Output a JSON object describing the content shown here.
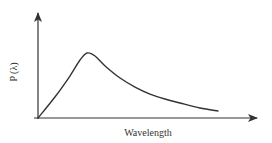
{
  "chart_data": {
    "type": "line",
    "title": "",
    "xlabel": "Wavelength",
    "ylabel": "P (λ)",
    "xlim": [
      0,
      1
    ],
    "ylim": [
      0,
      1
    ],
    "grid": false,
    "legend": null,
    "axis_ticks": false,
    "series": [
      {
        "name": "P(λ)",
        "color": "#333333",
        "x": [
          0.0,
          0.077,
          0.145,
          0.191,
          0.223,
          0.259,
          0.305,
          0.373,
          0.441,
          0.509,
          0.577,
          0.645,
          0.736,
          0.818
        ],
        "y": [
          0.0,
          0.198,
          0.396,
          0.547,
          0.613,
          0.585,
          0.491,
          0.377,
          0.292,
          0.226,
          0.179,
          0.142,
          0.094,
          0.066
        ]
      }
    ],
    "annotations": [
      "curve peaks at about λ≈0.22 then decays with a long tail"
    ]
  },
  "colors": {
    "axis": "#333333",
    "curve": "#333333",
    "background": "#ffffff"
  },
  "layout": {
    "origin_px": [
      38,
      118
    ],
    "x_end_px": 258,
    "y_top_px": 12
  }
}
